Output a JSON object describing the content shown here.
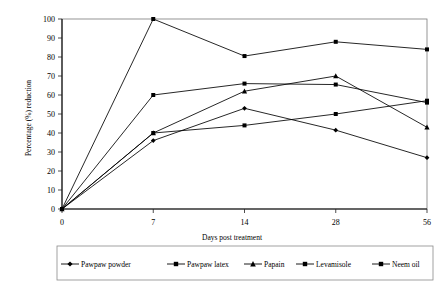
{
  "chart_data": {
    "type": "line",
    "title": "",
    "xlabel": "Days post treatment",
    "ylabel": "Percentage (%) reduction",
    "x_tick_labels": [
      "0",
      "7",
      "14",
      "28",
      "56"
    ],
    "categories": [
      0,
      7,
      14,
      28,
      56
    ],
    "y_tick_labels": [
      "0",
      "10",
      "20",
      "30",
      "40",
      "50",
      "60",
      "70",
      "80",
      "90",
      "100"
    ],
    "ylim": [
      0,
      100
    ],
    "y_tick_step": 10,
    "grid": false,
    "legend_position": "bottom",
    "plot_border": true,
    "series": [
      {
        "name": "Pawpaw powder",
        "marker": "diamond",
        "color": "#000000",
        "values": [
          0,
          36,
          53,
          41.5,
          27
        ]
      },
      {
        "name": "Pawpaw latex",
        "marker": "square",
        "color": "#000000",
        "values": [
          0,
          60,
          66,
          65.5,
          56
        ]
      },
      {
        "name": "Papain",
        "marker": "triangle",
        "color": "#000000",
        "values": [
          0,
          40,
          62,
          70,
          43
        ]
      },
      {
        "name": "Levamisole",
        "marker": "square",
        "color": "#000000",
        "values": [
          0,
          40,
          44,
          50,
          57
        ]
      },
      {
        "name": "Neem oil",
        "marker": "square",
        "color": "#000000",
        "values": [
          0,
          100,
          80.5,
          88,
          84
        ]
      }
    ]
  },
  "legend": {
    "items": [
      {
        "label": "Pawpaw powder"
      },
      {
        "label": "Pawpaw latex"
      },
      {
        "label": "Papain"
      },
      {
        "label": "Levamisole"
      },
      {
        "label": "Neem oil"
      }
    ]
  },
  "axes": {
    "y_title": "Percentage (%) reduction",
    "x_title": "Days post treatment"
  }
}
